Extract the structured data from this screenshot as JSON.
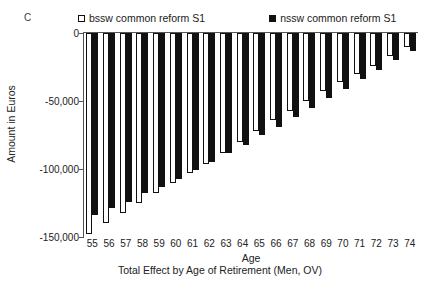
{
  "panel": {
    "label": "C"
  },
  "legend": {
    "position": "top",
    "entries": [
      {
        "label": "bssw common reform S1",
        "marker": "open-square",
        "color": "#ffffff"
      },
      {
        "label": "nssw common reform S1",
        "marker": "filled-square",
        "color": "#111111"
      }
    ]
  },
  "axes": {
    "y_title": "Amount in Euros",
    "x_title": "Age",
    "y_ticks": [
      "0",
      "-50,000",
      "-100,000",
      "-150,000"
    ]
  },
  "subtitle": "Total Effect by Age of Retirement (Men, OV)",
  "chart_data": {
    "type": "bar",
    "title": "",
    "subtitle": "Total Effect by Age of Retirement (Men, OV)",
    "panel_label": "C",
    "xlabel": "Age",
    "ylabel": "Amount in Euros",
    "ylim": [
      -150000,
      0
    ],
    "yticks": [
      0,
      -50000,
      -100000,
      -150000
    ],
    "ytick_labels": [
      "0",
      "-50,000",
      "-100,000",
      "-150,000"
    ],
    "grid": false,
    "legend_position": "top",
    "categories": [
      "55",
      "56",
      "57",
      "58",
      "59",
      "60",
      "61",
      "62",
      "63",
      "64",
      "65",
      "66",
      "67",
      "68",
      "69",
      "70",
      "71",
      "72",
      "73",
      "74"
    ],
    "series": [
      {
        "name": "bssw common reform S1",
        "marker": "open-square",
        "color": "#ffffff",
        "values": [
          -148000,
          -140000,
          -132000,
          -125000,
          -118000,
          -110000,
          -103000,
          -96000,
          -88000,
          -80000,
          -72000,
          -64000,
          -57000,
          -50000,
          -43000,
          -36000,
          -30000,
          -24000,
          -17000,
          -10000
        ]
      },
      {
        "name": "nssw common reform S1",
        "marker": "filled-square",
        "color": "#111111",
        "values": [
          -134000,
          -129000,
          -124000,
          -118000,
          -113000,
          -107000,
          -101000,
          -95000,
          -88000,
          -82000,
          -75000,
          -69000,
          -62000,
          -55000,
          -48000,
          -41000,
          -34000,
          -27000,
          -20000,
          -13000
        ]
      }
    ]
  }
}
